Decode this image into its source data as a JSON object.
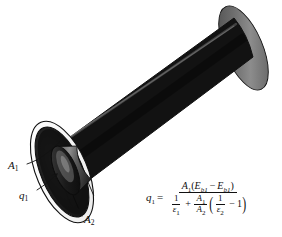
{
  "figure": {
    "background_color": "#ffffff",
    "object": {
      "name": "concentric-cylinders",
      "description": "Long dark cylindrical shell shown in oblique view, open at the near (lower-left) end, revealing a white annular rim, a dark annular cavity and an inner cylinder",
      "body_color_dark": "#141414",
      "body_color_mid": "#3d3d3d",
      "body_color_light": "#8f8f8f",
      "rim_color": "#ffffff",
      "outline_color": "#101010"
    }
  },
  "labels": {
    "a1": {
      "text": "A",
      "sub": "1",
      "name": "inner-surface-area-label"
    },
    "q1": {
      "text": "q",
      "sub": "1",
      "name": "heat-rate-label"
    },
    "a2": {
      "text": "A",
      "sub": "2",
      "name": "outer-surface-area-label"
    }
  },
  "equation": {
    "name": "radiation-heat-transfer-equation",
    "plain_text": "q1 = A1(Eb1 - Eb2) / [ 1/e1 + (A1/A2)(1/e2 - 1) ]",
    "lhs": {
      "symbol": "q",
      "sub": "1"
    },
    "relation": "=",
    "numerator": {
      "area": {
        "symbol": "A",
        "sub": "1"
      },
      "open_paren": "(",
      "term1": {
        "symbol": "E",
        "sub": "b1"
      },
      "operator": "−",
      "term2": {
        "symbol": "E",
        "sub": "b1"
      },
      "close_paren": ")"
    },
    "denominator": {
      "frac1": {
        "numerator": "1",
        "denominator_symbol": "ε",
        "denominator_sub": "1"
      },
      "plus": "+",
      "frac2": {
        "numerator_symbol": "A",
        "numerator_sub": "1",
        "denominator_symbol": "A",
        "denominator_sub": "2"
      },
      "open_paren": "(",
      "frac3": {
        "numerator": "1",
        "denominator_symbol": "ε",
        "denominator_sub": "2"
      },
      "minus": "−",
      "one": "1",
      "close_paren": ")"
    }
  }
}
